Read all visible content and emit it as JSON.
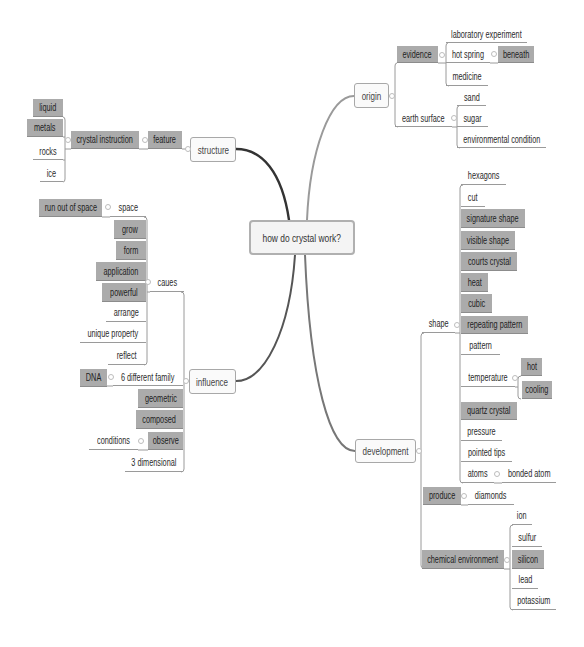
{
  "mindmap": {
    "central_topic": "how do crystal work?",
    "structure": {
      "label": "structure",
      "feature": {
        "label": "feature",
        "crystal_instruction": {
          "label": "crystal instruction",
          "children": [
            "liquid",
            "metals",
            "rocks",
            "ice"
          ]
        }
      }
    },
    "origin": {
      "label": "origin",
      "evidence": {
        "label": "evidence",
        "children": [
          {
            "label": "laboratory experiment"
          },
          {
            "label": "hot spring",
            "child": "beneath"
          },
          {
            "label": "medicine"
          }
        ]
      },
      "earth_surface": {
        "label": "earth surface",
        "children": [
          "sand",
          "sugar",
          "environmental condition"
        ]
      }
    },
    "influence": {
      "label": "influence",
      "caues": {
        "label": "caues",
        "children": [
          {
            "label": "space",
            "child": "run out of space"
          },
          {
            "label": "grow"
          },
          {
            "label": "form"
          },
          {
            "label": "application"
          },
          {
            "label": "powerful"
          },
          {
            "label": "arrange"
          },
          {
            "label": "unique property"
          },
          {
            "label": "reflect"
          }
        ]
      },
      "children": [
        {
          "label": "6 different family",
          "child": "DNA"
        },
        {
          "label": "geometric"
        },
        {
          "label": "composed"
        },
        {
          "label": "observe",
          "child": "conditions"
        },
        {
          "label": "3 dimensional"
        }
      ]
    },
    "development": {
      "label": "development",
      "shape": {
        "label": "shape",
        "children": [
          {
            "label": "hexagons"
          },
          {
            "label": "cut"
          },
          {
            "label": "signature shape"
          },
          {
            "label": "visible shape"
          },
          {
            "label": "courts crystal"
          },
          {
            "label": "heat"
          },
          {
            "label": "cubic"
          },
          {
            "label": "repeating pattern"
          },
          {
            "label": "pattern"
          },
          {
            "label": "temperature",
            "children": [
              "hot",
              "cooling"
            ]
          },
          {
            "label": "quartz crystal"
          },
          {
            "label": "pressure"
          },
          {
            "label": "pointed tips"
          },
          {
            "label": "atoms",
            "child": "bonded atom"
          }
        ]
      },
      "produce": {
        "label": "produce",
        "child": "diamonds"
      },
      "chemical_environment": {
        "label": "chemical environment",
        "children": [
          "ion",
          "sulfur",
          "silicon",
          "lead",
          "potassium"
        ]
      }
    }
  },
  "colors": {
    "highlight_fill": "#ababab",
    "branch_line_dark": "#333333",
    "branch_line_gray": "#999999",
    "node_border": "#a8a8a8",
    "background": "#ffffff"
  }
}
